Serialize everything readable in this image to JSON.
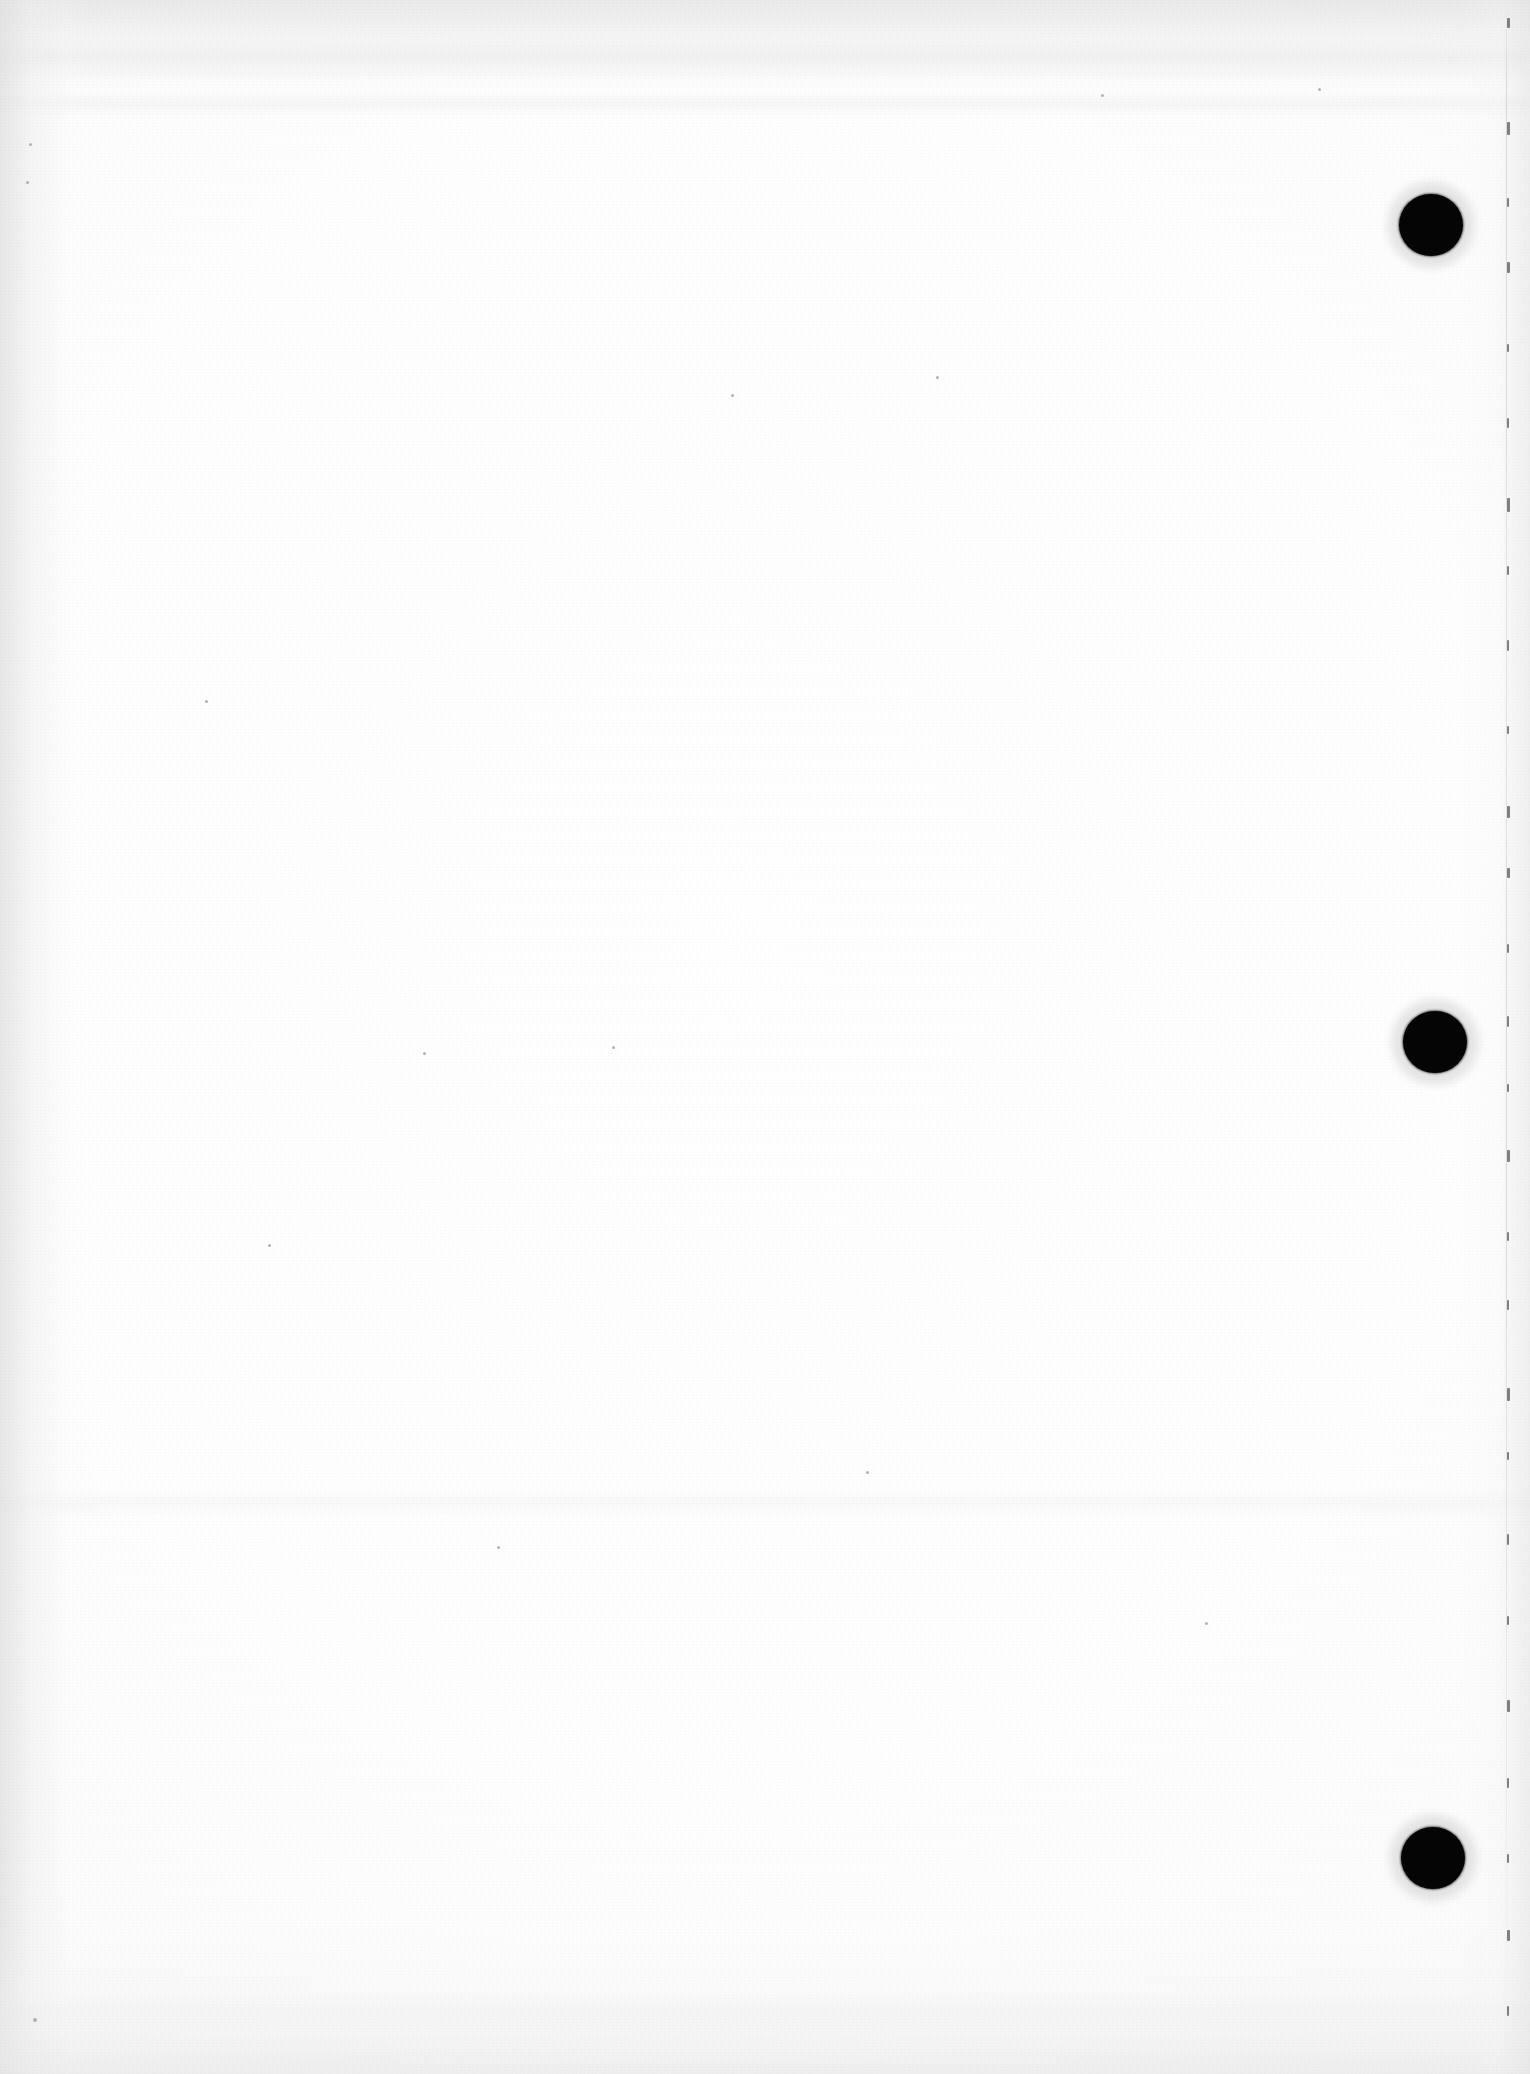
{
  "document": {
    "kind": "scanned-page",
    "description": "Blank scanned sheet of paper",
    "visible_text": "",
    "page_label": "",
    "width_px": 1530,
    "height_px": 2074
  },
  "paper": {
    "base_color": "#fdfdfd",
    "highlight_color": "#ffffff",
    "shadow_color": "#f2f2f2",
    "texture": "fine scan grain with faint horizontal smudge bands"
  },
  "punch_holes": {
    "count": 3,
    "color": "#050505",
    "items": [
      {
        "name": "punch-hole-top",
        "cx": 1431,
        "cy": 225,
        "rx": 32,
        "ry": 31
      },
      {
        "name": "punch-hole-middle",
        "cx": 1435,
        "cy": 1042,
        "rx": 32,
        "ry": 31
      },
      {
        "name": "punch-hole-bottom",
        "cx": 1433,
        "cy": 1858,
        "rx": 32,
        "ry": 31
      }
    ]
  },
  "sheet_edge": {
    "name": "right-sheet-edge",
    "x": 1506,
    "color": "#bebec1",
    "ticks": [
      {
        "y": 18,
        "w": 3,
        "h": 10
      },
      {
        "y": 122,
        "w": 3,
        "h": 13
      },
      {
        "y": 198,
        "w": 2,
        "h": 9
      },
      {
        "y": 262,
        "w": 3,
        "h": 11
      },
      {
        "y": 344,
        "w": 2,
        "h": 8
      },
      {
        "y": 418,
        "w": 2,
        "h": 10
      },
      {
        "y": 498,
        "w": 3,
        "h": 14
      },
      {
        "y": 566,
        "w": 2,
        "h": 9
      },
      {
        "y": 640,
        "w": 2,
        "h": 11
      },
      {
        "y": 726,
        "w": 2,
        "h": 8
      },
      {
        "y": 806,
        "w": 3,
        "h": 12
      },
      {
        "y": 868,
        "w": 3,
        "h": 10
      },
      {
        "y": 944,
        "w": 2,
        "h": 9
      },
      {
        "y": 1016,
        "w": 2,
        "h": 11
      },
      {
        "y": 1084,
        "w": 2,
        "h": 8
      },
      {
        "y": 1150,
        "w": 3,
        "h": 12
      },
      {
        "y": 1232,
        "w": 2,
        "h": 9
      },
      {
        "y": 1300,
        "w": 2,
        "h": 10
      },
      {
        "y": 1388,
        "w": 3,
        "h": 13
      },
      {
        "y": 1452,
        "w": 2,
        "h": 8
      },
      {
        "y": 1534,
        "w": 2,
        "h": 11
      },
      {
        "y": 1616,
        "w": 2,
        "h": 9
      },
      {
        "y": 1700,
        "w": 3,
        "h": 12
      },
      {
        "y": 1778,
        "w": 2,
        "h": 10
      },
      {
        "y": 1854,
        "w": 2,
        "h": 9
      },
      {
        "y": 1930,
        "w": 3,
        "h": 11
      },
      {
        "y": 2006,
        "w": 2,
        "h": 10
      }
    ]
  },
  "specks": [
    {
      "x": 33,
      "y": 2018,
      "d": 4
    },
    {
      "x": 29,
      "y": 143,
      "d": 3
    },
    {
      "x": 26,
      "y": 181,
      "d": 3
    },
    {
      "x": 268,
      "y": 1244,
      "d": 3
    },
    {
      "x": 423,
      "y": 1052,
      "d": 3
    },
    {
      "x": 612,
      "y": 1046,
      "d": 3
    },
    {
      "x": 1318,
      "y": 88,
      "d": 3
    },
    {
      "x": 1101,
      "y": 94,
      "d": 3
    },
    {
      "x": 731,
      "y": 394,
      "d": 3
    },
    {
      "x": 936,
      "y": 376,
      "d": 3
    },
    {
      "x": 497,
      "y": 1546,
      "d": 3
    },
    {
      "x": 866,
      "y": 1471,
      "d": 3
    },
    {
      "x": 205,
      "y": 700,
      "d": 3
    },
    {
      "x": 1205,
      "y": 1622,
      "d": 3
    }
  ]
}
